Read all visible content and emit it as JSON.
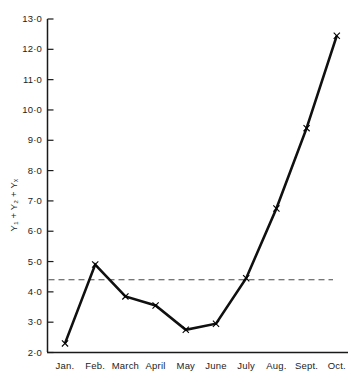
{
  "chart_data": {
    "type": "line",
    "title": "",
    "subtitle": "",
    "xlabel": "",
    "ylabel": "Y₁ + Y₂ + Yₓ",
    "categories": [
      "Jan.",
      "Feb.",
      "March",
      "April",
      "May",
      "June",
      "July",
      "Aug.",
      "Sept.",
      "Oct."
    ],
    "values": [
      2.3,
      4.9,
      3.85,
      3.55,
      2.75,
      2.95,
      4.45,
      6.75,
      9.4,
      12.45
    ],
    "series": [
      {
        "name": "Y1 + Y2 + Yx",
        "values": [
          2.3,
          4.9,
          3.85,
          3.55,
          2.75,
          2.95,
          4.45,
          6.75,
          9.4,
          12.45
        ],
        "marker": "x",
        "line_style": "solid",
        "color": "#101010"
      }
    ],
    "reference_line": {
      "value": 4.4,
      "style": "dashed",
      "color": "#4a4a4a",
      "label": ""
    },
    "ylim": [
      2.0,
      13.0
    ],
    "y_ticks": [
      2.0,
      3.0,
      4.0,
      5.0,
      6.0,
      7.0,
      8.0,
      9.0,
      10.0,
      11.0,
      12.0,
      13.0
    ],
    "y_tick_labels": [
      "2·0",
      "3·0",
      "4·0",
      "5·0",
      "6·0",
      "7·0",
      "8·0",
      "9·0",
      "10·0",
      "11·0",
      "12·0",
      "13·0"
    ],
    "x_tick_labels": [
      "Jan.",
      "Feb.",
      "March",
      "April",
      "May",
      "June",
      "July",
      "Aug.",
      "Sept.",
      "Oct."
    ],
    "grid": false,
    "legend": false,
    "legend_position": "none",
    "axis_color": "#1a1a1a",
    "background": "#ffffff"
  }
}
